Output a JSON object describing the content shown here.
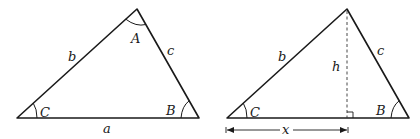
{
  "figure": {
    "left_triangle": {
      "vertices": {
        "C": {
          "x": 17,
          "y": 118
        },
        "A": {
          "x": 137,
          "y": 9
        },
        "B": {
          "x": 199,
          "y": 118
        }
      },
      "angle_labels": {
        "A": "A",
        "B": "B",
        "C": "C"
      },
      "side_labels": {
        "a": "a",
        "b": "b",
        "c": "c"
      }
    },
    "right_triangle": {
      "vertices": {
        "C": {
          "x": 227,
          "y": 118
        },
        "top": {
          "x": 347,
          "y": 9
        },
        "B": {
          "x": 409,
          "y": 118
        }
      },
      "angle_labels": {
        "B": "B",
        "C": "C"
      },
      "side_labels": {
        "b": "b",
        "c": "c"
      },
      "altitude_label": "h",
      "dimension_label": "x"
    },
    "colors": {
      "stroke": "#1a1a1a",
      "background": "#ffffff"
    }
  }
}
